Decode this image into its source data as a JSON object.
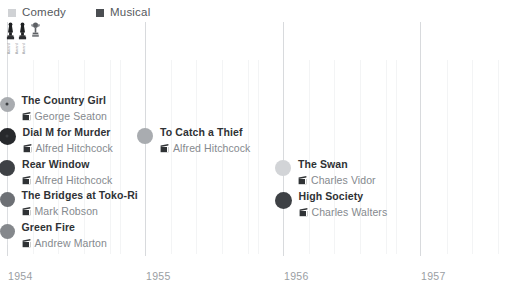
{
  "chart_data": {
    "type": "scatter",
    "title": "",
    "subtitle": "",
    "xlabel": "",
    "ylabel": "",
    "orientation": "timeline",
    "grid": true,
    "legend_position": "top-left",
    "axis": {
      "ticks": [
        "1954",
        "1955",
        "1956",
        "1957"
      ],
      "tick_x": [
        7,
        145,
        283,
        420
      ],
      "minor_ticks": true,
      "xlim": [
        "1954",
        "1957.7"
      ]
    },
    "legend": [
      {
        "label": "Comedy",
        "color": "#d0d2d5",
        "marker": "square"
      },
      {
        "label": "Musical",
        "color": "#4b4e52",
        "marker": "square"
      }
    ],
    "categories": [
      "Comedy",
      "Musical"
    ],
    "awards": {
      "icons": [
        "oscar-statuette",
        "oscar-statuette",
        "oscar-trophy"
      ],
      "labels": [
        "Award",
        "Award",
        "Award"
      ]
    },
    "points": [
      {
        "title": "The Country Girl",
        "director": "George Seaton",
        "year": "1954",
        "x": 7,
        "y": 104,
        "color": "#a9acb0",
        "size": 15,
        "has_core": true,
        "label_side": "right"
      },
      {
        "title": "Dial M for Murder",
        "director": "Alfred Hitchcock",
        "year": "1954",
        "x": 7,
        "y": 136,
        "color": "#27292c",
        "size": 17,
        "has_core": true,
        "label_side": "right"
      },
      {
        "title": "Rear Window",
        "director": "Alfred Hitchcock",
        "year": "1954",
        "x": 7,
        "y": 168,
        "color": "#3e4145",
        "size": 16,
        "has_core": false,
        "label_side": "right"
      },
      {
        "title": "The Bridges at Toko-Ri",
        "director": "Mark Robson",
        "year": "1954",
        "x": 7,
        "y": 199,
        "color": "#6d7075",
        "size": 15,
        "has_core": false,
        "label_side": "right"
      },
      {
        "title": "Green Fire",
        "director": "Andrew Marton",
        "year": "1954",
        "x": 7,
        "y": 231,
        "color": "#85888c",
        "size": 15,
        "has_core": false,
        "label_side": "right"
      },
      {
        "title": "To Catch a Thief",
        "director": "Alfred Hitchcock",
        "year": "1955",
        "x": 145,
        "y": 136,
        "color": "#a9acb0",
        "size": 16,
        "has_core": false,
        "label_side": "right"
      },
      {
        "title": "The Swan",
        "director": "Charles Vidor",
        "year": "1956",
        "x": 283,
        "y": 168,
        "color": "#d2d4d7",
        "size": 16,
        "has_core": false,
        "label_side": "right"
      },
      {
        "title": "High Society",
        "director": "Charles Walters",
        "year": "1956",
        "x": 283,
        "y": 200,
        "color": "#3e4145",
        "size": 17,
        "has_core": false,
        "label_side": "right"
      }
    ],
    "minor_gridline_x": [
      33,
      58,
      84,
      110,
      120,
      171,
      196,
      222,
      248,
      258,
      309,
      334,
      360,
      386,
      396,
      447,
      472,
      498
    ]
  }
}
